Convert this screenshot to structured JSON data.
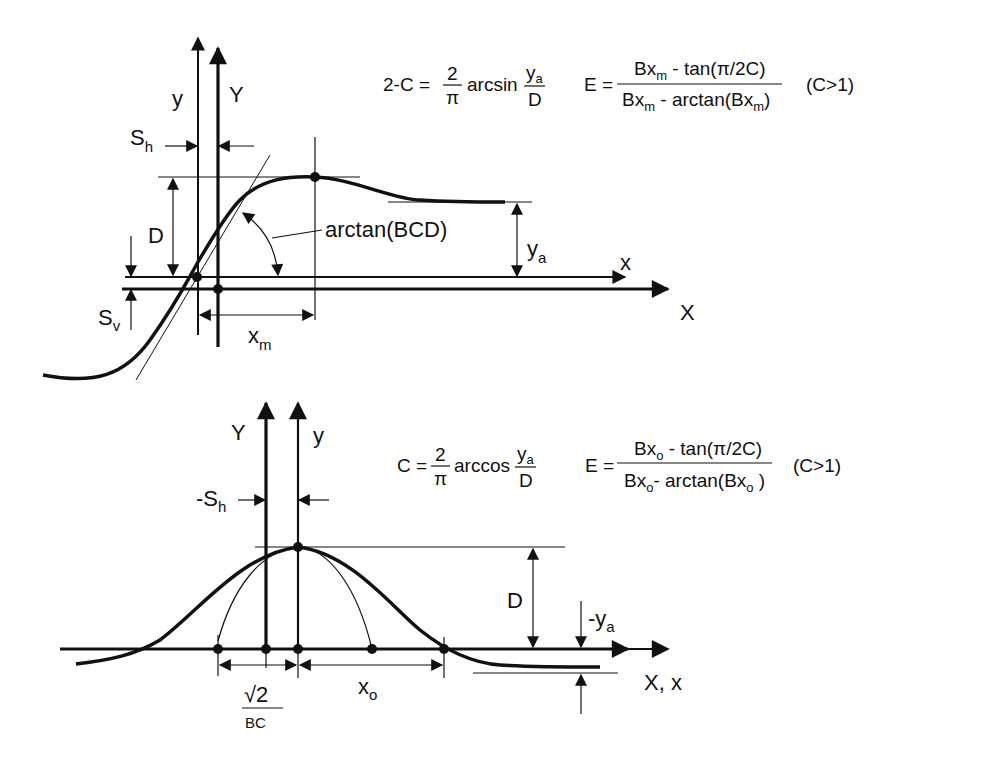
{
  "figure": {
    "top_diagram": {
      "axis_labels": {
        "y_local": "y",
        "Y_global": "Y",
        "x_local": "x",
        "X_global": "X"
      },
      "dimension_labels": {
        "horizontal_shift": {
          "base": "S",
          "sub": "h"
        },
        "vertical_shift": {
          "base": "S",
          "sub": "v"
        },
        "peak_value": "D",
        "asymptote": {
          "base": "y",
          "sub": "a"
        },
        "peak_position": {
          "base": "x",
          "sub": "m"
        },
        "slope": "arctan(BCD)"
      },
      "equation_C": {
        "lhs": "2-C =",
        "num": "2",
        "den": "π",
        "func": "arcsin",
        "frac_num": {
          "base": "y",
          "sub": "a"
        },
        "frac_den": "D"
      },
      "equation_E": {
        "lhs": "E =",
        "num_pre": "Bx",
        "num_sub": "m",
        "num_post": " - tan(π/2C)",
        "den_pre": "Bx",
        "den_sub": "m",
        "den_mid": " - arctan(Bx",
        "den_sub2": "m",
        "den_post": ")",
        "condition": "(C>1)"
      }
    },
    "bottom_diagram": {
      "axis_labels": {
        "Y_global": "Y",
        "y_local": "y",
        "Xx": "X, x"
      },
      "dimension_labels": {
        "horizontal_shift": {
          "base": "-S",
          "sub": "h"
        },
        "peak_value": "D",
        "asymptote": {
          "base": "-y",
          "sub": "a"
        },
        "zero_position": {
          "base": "x",
          "sub": "o"
        },
        "width_num": "√2",
        "width_den": "BC"
      },
      "equation_C": {
        "lhs": "C =",
        "num": "2",
        "den": "π",
        "func": "arccos",
        "frac_num": {
          "base": "y",
          "sub": "a"
        },
        "frac_den": "D"
      },
      "equation_E": {
        "lhs": "E =",
        "num_pre": "Bx",
        "num_sub": "o",
        "num_post": " - tan(π/2C)",
        "den_pre": "Bx",
        "den_sub": "o",
        "den_mid": "- arctan(Bx",
        "den_sub2": "o",
        "den_post": " )",
        "condition": "(C>1)"
      }
    }
  }
}
